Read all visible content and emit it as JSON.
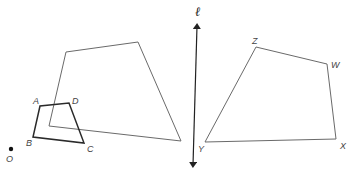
{
  "figure": {
    "colors": {
      "thin_stroke": "#6a6a6a",
      "bold_stroke": "#2a2a2a",
      "point": "#111111"
    },
    "center_point": {
      "label": "O",
      "x": 11,
      "y": 149,
      "label_x": 6,
      "label_y": 162
    },
    "line_l": {
      "label": "ℓ",
      "x1": 197,
      "y1": 26,
      "x2": 193,
      "y2": 165,
      "label_x": 195,
      "label_y": 16
    },
    "small_quad": {
      "name": "ABCD",
      "vertices": [
        {
          "label": "A",
          "x": 40,
          "y": 106,
          "label_x": 33,
          "label_y": 104
        },
        {
          "label": "B",
          "x": 33,
          "y": 137,
          "label_x": 26,
          "label_y": 146
        },
        {
          "label": "C",
          "x": 84,
          "y": 143,
          "label_x": 87,
          "label_y": 152
        },
        {
          "label": "D",
          "x": 69,
          "y": 103,
          "label_x": 72,
          "label_y": 104
        }
      ]
    },
    "large_quad": {
      "name": "unlabeled dilation image",
      "vertices": [
        {
          "x": 66,
          "y": 52
        },
        {
          "x": 138,
          "y": 42
        },
        {
          "x": 181,
          "y": 141
        },
        {
          "x": 49,
          "y": 126
        }
      ]
    },
    "reflected_quad": {
      "name": "WXYZ",
      "vertices": [
        {
          "label": "Z",
          "x": 256,
          "y": 47,
          "label_x": 252,
          "label_y": 44
        },
        {
          "label": "W",
          "x": 327,
          "y": 64,
          "label_x": 331,
          "label_y": 68
        },
        {
          "label": "X",
          "x": 336,
          "y": 139,
          "label_x": 340,
          "label_y": 149
        },
        {
          "label": "Y",
          "x": 205,
          "y": 142,
          "label_x": 198,
          "label_y": 152
        }
      ]
    }
  }
}
